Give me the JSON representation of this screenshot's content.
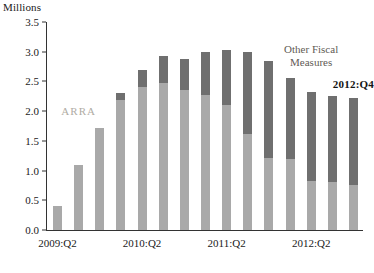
{
  "chart_data": {
    "type": "bar",
    "stacked": true,
    "title": "",
    "subtitle": "",
    "ylabel": "Millions",
    "xlabel": "",
    "ylim": [
      0.0,
      3.5
    ],
    "ytick_labels": [
      "0.0",
      "0.5",
      "1.0",
      "1.5",
      "2.0",
      "2.5",
      "3.0",
      "3.5"
    ],
    "ytick_values": [
      0.0,
      0.5,
      1.0,
      1.5,
      2.0,
      2.5,
      3.0,
      3.5
    ],
    "grid": false,
    "legend_position": "in-plot-annotations",
    "categories": [
      "2009:Q2",
      "2009:Q3",
      "2009:Q4",
      "2010:Q1",
      "2010:Q2",
      "2010:Q3",
      "2010:Q4",
      "2011:Q1",
      "2011:Q2",
      "2011:Q3",
      "2011:Q4",
      "2012:Q1",
      "2012:Q2",
      "2012:Q3",
      "2012:Q4"
    ],
    "xtick_labels": [
      "2009:Q2",
      "2010:Q2",
      "2011:Q2",
      "2012:Q2"
    ],
    "xtick_category_index": [
      0,
      4,
      8,
      12
    ],
    "series": [
      {
        "name": "ARRA",
        "color": "#a9a9a9",
        "values": [
          0.4,
          1.1,
          1.72,
          2.18,
          2.4,
          2.48,
          2.35,
          2.28,
          2.1,
          1.62,
          1.22,
          1.2,
          0.82,
          0.8,
          0.75
        ]
      },
      {
        "name": "Other Fiscal Measures",
        "color": "#6f6f6f",
        "values": [
          0.0,
          0.0,
          0.0,
          0.12,
          0.3,
          0.45,
          0.52,
          0.72,
          0.93,
          1.38,
          1.63,
          1.35,
          1.5,
          1.45,
          1.47
        ]
      }
    ],
    "totals": [
      0.4,
      1.1,
      1.72,
      2.3,
      2.7,
      2.93,
      2.87,
      3.0,
      3.03,
      3.0,
      2.85,
      2.55,
      2.32,
      2.25,
      2.22
    ],
    "annotations": [
      {
        "text": "ARRA",
        "category_index": 1,
        "value": 2.0,
        "style": "arra"
      },
      {
        "text": "Other Fiscal\nMeasures",
        "category_index": 12,
        "value": 3.15,
        "style": "other"
      },
      {
        "text": "2012:Q4",
        "category_index": 14,
        "value": 2.55,
        "style": "last"
      }
    ]
  },
  "labels": {
    "y_unit": "Millions",
    "arra": "ARRA",
    "other_fiscal_line1": "Other Fiscal",
    "other_fiscal_line2": "Measures",
    "last_point": "2012:Q4"
  }
}
